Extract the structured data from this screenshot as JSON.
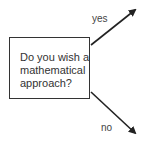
{
  "diagram": {
    "decision": {
      "line1": "Do you wish a",
      "line2": "mathematical",
      "line3": "approach?"
    },
    "branches": {
      "yes": "yes",
      "no": "no"
    }
  }
}
